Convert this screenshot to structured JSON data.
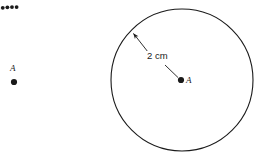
{
  "figure": {
    "background_color": "#ffffff",
    "stroke_color": "#1a1a1a",
    "width": 259,
    "height": 162,
    "left_shape": {
      "type": "dotted-arc",
      "center": {
        "x": 14,
        "y": 82
      },
      "radius": 75,
      "start_angle_deg": 180,
      "end_angle_deg": 88,
      "dot_count": 27,
      "dot_radius": 1.9,
      "point_label": "A",
      "point_dot_radius": 3.1
    },
    "right_shape": {
      "type": "circle",
      "center": {
        "x": 182,
        "y": 80
      },
      "radius": 71,
      "stroke_width": 1.1,
      "point_label": "A",
      "point_dot_radius": 3.1,
      "radius_arrow": {
        "label": "2 cm",
        "from": {
          "x": 178,
          "y": 77
        },
        "to": {
          "x": 132,
          "y": 32
        }
      }
    }
  },
  "labels": {
    "left_point": "A",
    "right_point": "A",
    "radius_measure": "2 cm"
  }
}
